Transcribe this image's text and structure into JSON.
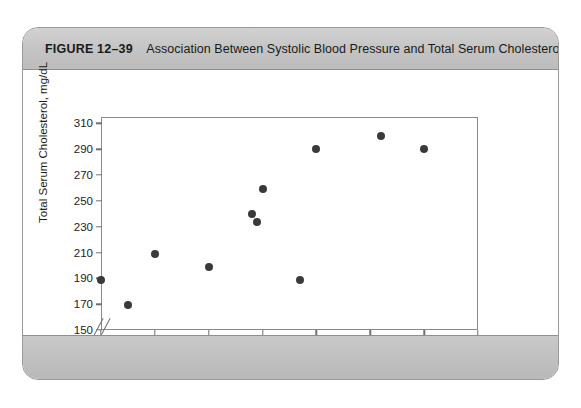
{
  "figure": {
    "number": "FIGURE 12–39",
    "caption": "Association Between Systolic Blood Pressure and Total Serum Cholesterol"
  },
  "chart_data": {
    "type": "scatter",
    "title": "Association Between Systolic Blood Pressure and Total Serum Cholesterol",
    "xlabel": "Systolic Blood Pressure, mm Hg",
    "ylabel": "Total Serum Cholesterol, mg/dL",
    "xlim": [
      100,
      170
    ],
    "ylim": [
      150,
      315
    ],
    "xticks": [
      100,
      110,
      120,
      130,
      140,
      150,
      160,
      170
    ],
    "yticks": [
      150,
      170,
      190,
      210,
      230,
      250,
      270,
      290,
      310
    ],
    "xtick_labels": [
      "100",
      "110",
      "120",
      "130",
      "140",
      "150",
      "160",
      "170"
    ],
    "ytick_labels": [
      "150",
      "170",
      "190",
      "210",
      "230",
      "250",
      "270",
      "290",
      "310"
    ],
    "grid": false,
    "legend": null,
    "axis_break": {
      "axis": "y",
      "at": 155,
      "style": "double-slash"
    },
    "marker": {
      "shape": "circle",
      "color": "#3a3a3a",
      "size": 8
    },
    "points": [
      {
        "x": 100,
        "y": 189
      },
      {
        "x": 105,
        "y": 169
      },
      {
        "x": 110,
        "y": 209
      },
      {
        "x": 120,
        "y": 199
      },
      {
        "x": 128,
        "y": 240
      },
      {
        "x": 129,
        "y": 234
      },
      {
        "x": 130,
        "y": 259
      },
      {
        "x": 137,
        "y": 189
      },
      {
        "x": 140,
        "y": 290
      },
      {
        "x": 152,
        "y": 300
      },
      {
        "x": 160,
        "y": 290
      }
    ]
  },
  "colors": {
    "marker": "#3a3a3a",
    "axis": "#8a8a8a",
    "banner": "#c4c4c4",
    "card_border": "#9a9a9a"
  }
}
